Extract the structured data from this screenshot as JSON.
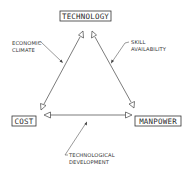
{
  "diagram": {
    "type": "triangle-relationship",
    "colors": {
      "ink": "#333333",
      "background": "#ffffff"
    },
    "nodes": {
      "technology": {
        "label": "TECHNOLOGY"
      },
      "cost": {
        "label": "COST"
      },
      "manpower": {
        "label": "MANPOWER"
      }
    },
    "edges": [
      {
        "from": "technology",
        "to": "cost",
        "annotation": "economic_climate"
      },
      {
        "from": "technology",
        "to": "manpower",
        "annotation": "skill_availability"
      },
      {
        "from": "cost",
        "to": "manpower",
        "annotation": "technological_development"
      }
    ],
    "annotations": {
      "economic_climate": {
        "line1": "ECONOMIC",
        "line2": "CLIMATE"
      },
      "skill_availability": {
        "line1": "SKILL",
        "line2": "AVAILABILITY"
      },
      "technological_development": {
        "line1": "TECHNOLOGICAL",
        "line2": "DEVELOPMENT"
      }
    }
  }
}
